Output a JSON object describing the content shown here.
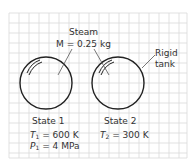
{
  "diagram": {
    "top_label": {
      "line1": "Steam",
      "line2": "M = 0.25 kg"
    },
    "tank_label": {
      "line1": "Rigid",
      "line2": "tank"
    },
    "states": [
      {
        "name": "State 1",
        "T_var": "T",
        "T_sub": "1",
        "T_value": "= 600 K",
        "P_var": "P",
        "P_sub": "1",
        "P_value": "= 4 MPa"
      },
      {
        "name": "State 2",
        "T_var": "T",
        "T_sub": "2",
        "T_value": "= 300 K"
      }
    ],
    "colors": {
      "grid": "#d8d8d8",
      "grid_border": "#cfcfcf",
      "stroke": "#222222",
      "text": "#333333"
    }
  }
}
